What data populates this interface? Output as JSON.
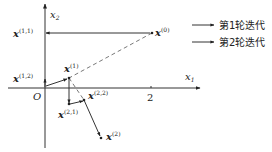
{
  "axes": {
    "x_label": "x",
    "x_sub": "1",
    "y_label": "x",
    "y_sub": "2",
    "origin_label": "O",
    "tick_label": "2"
  },
  "points": {
    "p0": {
      "base": "x",
      "sup": "(0)"
    },
    "p11": {
      "base": "x",
      "sup": "(1,1)"
    },
    "p12": {
      "base": "x",
      "sup": "(1,2)"
    },
    "p1": {
      "base": "x",
      "sup": "(1)"
    },
    "p21": {
      "base": "x",
      "sup": "(2,1)"
    },
    "p22": {
      "base": "x",
      "sup": "(2,2)"
    },
    "p2": {
      "base": "x",
      "sup": "(2)"
    }
  },
  "legend": {
    "items": [
      {
        "label": "第1轮迭代"
      },
      {
        "label": "第2轮迭代"
      }
    ]
  },
  "colors": {
    "line": "#333333",
    "dashed": "#555555"
  }
}
